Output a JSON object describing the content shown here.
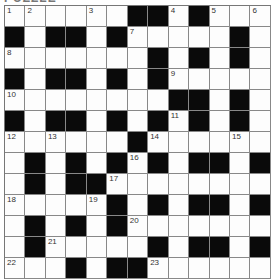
{
  "title": "PUZZLE",
  "grid": {
    "rows": 13,
    "cols": 13,
    "layout": [
      "WWWWWWBBWBWWW",
      "BWBBWBWWWWWBW",
      "WWWWWWWBWBWBW",
      "BWBBWBWBWWWWW",
      "WWWWWWWWBBWBW",
      "BWBBWBWBWBWBW",
      "WWWWWWBWWWWWW",
      "WBWBWBWBWBBWB",
      "WBWBBWWWWWWWW",
      "WWWWWBWBWBBWB",
      "WBWBWBWWWWWWW",
      "WBWWWWWBWBBWB",
      "WWWBWBBWWWWWW"
    ],
    "numbers": [
      {
        "row": 0,
        "col": 0,
        "n": "1"
      },
      {
        "row": 0,
        "col": 1,
        "n": "2"
      },
      {
        "row": 0,
        "col": 4,
        "n": "3"
      },
      {
        "row": 0,
        "col": 8,
        "n": "4"
      },
      {
        "row": 0,
        "col": 10,
        "n": "5"
      },
      {
        "row": 0,
        "col": 12,
        "n": "6"
      },
      {
        "row": 1,
        "col": 6,
        "n": "7"
      },
      {
        "row": 2,
        "col": 0,
        "n": "8"
      },
      {
        "row": 3,
        "col": 8,
        "n": "9"
      },
      {
        "row": 4,
        "col": 0,
        "n": "10"
      },
      {
        "row": 5,
        "col": 8,
        "n": "11"
      },
      {
        "row": 6,
        "col": 0,
        "n": "12"
      },
      {
        "row": 6,
        "col": 2,
        "n": "13"
      },
      {
        "row": 6,
        "col": 7,
        "n": "14"
      },
      {
        "row": 6,
        "col": 11,
        "n": "15"
      },
      {
        "row": 7,
        "col": 6,
        "n": "16"
      },
      {
        "row": 8,
        "col": 5,
        "n": "17"
      },
      {
        "row": 9,
        "col": 0,
        "n": "18"
      },
      {
        "row": 9,
        "col": 4,
        "n": "19"
      },
      {
        "row": 10,
        "col": 6,
        "n": "20"
      },
      {
        "row": 11,
        "col": 2,
        "n": "21"
      },
      {
        "row": 12,
        "col": 0,
        "n": "22"
      },
      {
        "row": 12,
        "col": 7,
        "n": "23"
      }
    ]
  },
  "colors": {
    "black_cell": "#0a0a0a",
    "white_cell": "#fdfdfd",
    "grid_line": "#888888"
  }
}
